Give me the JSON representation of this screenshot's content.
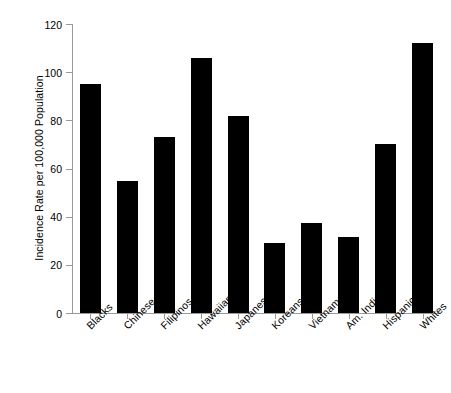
{
  "chart_data": {
    "type": "bar",
    "title": "",
    "xlabel": "",
    "ylabel": "Incidence Rate per 100,000 Population",
    "ylim": [
      0,
      120
    ],
    "yticks": [
      0,
      20,
      40,
      60,
      80,
      100,
      120
    ],
    "grid": false,
    "legend": "none",
    "bar_color": "#000000",
    "axis_color": "#9a9a9a",
    "categories": [
      "Blacks",
      "Chinese",
      "Filipinos",
      "Hawaiians",
      "Japanese",
      "Koreans",
      "Vietnamese",
      "Am. Indians",
      "Hispanics",
      "Whites"
    ],
    "values": [
      95,
      55,
      73,
      106,
      82,
      29,
      37.5,
      31.5,
      70,
      112
    ]
  }
}
